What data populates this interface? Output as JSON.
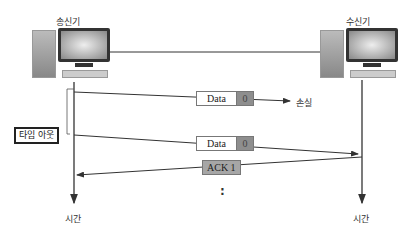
{
  "sender": {
    "label": "송신기",
    "time_label": "시간"
  },
  "receiver": {
    "label": "수신기",
    "time_label": "시간"
  },
  "messages": [
    {
      "type": "data",
      "name": "Data",
      "seq": "0",
      "direction": "sender-to-receiver",
      "outcome": "손실"
    },
    {
      "type": "data",
      "name": "Data",
      "seq": "0",
      "direction": "sender-to-receiver"
    },
    {
      "type": "ack",
      "name": "ACK 1",
      "direction": "receiver-to-sender"
    }
  ],
  "timeout_label": "타임 아웃",
  "continuation": ":",
  "colors": {
    "line": "#333333",
    "seq_fill": "#8e8e8e",
    "ack_fill": "#a6a6a6"
  }
}
